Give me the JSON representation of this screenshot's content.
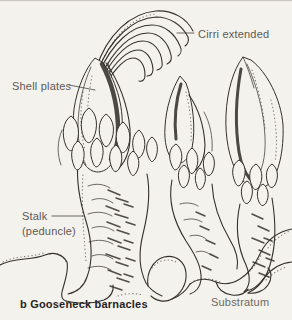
{
  "figure": {
    "caption": "b Gooseneck barnacles",
    "labels": {
      "cirri": "Cirri extended",
      "shell_plates": "Shell plates",
      "stalk": "Stalk",
      "stalk_sub": "(peduncle)",
      "substratum": "Substratum"
    },
    "colors": {
      "background": "#f4f2ed",
      "ink": "#34312c",
      "label_text": "#5d5953",
      "caption_text": "#26231f",
      "substratum_text": "#6e6961"
    }
  }
}
